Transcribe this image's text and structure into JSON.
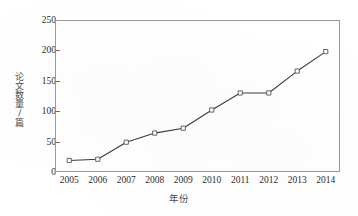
{
  "chart_data": {
    "type": "line",
    "title": "",
    "subtitle": "",
    "xlabel": "年份",
    "ylabel": "论文数量/篇",
    "categories": [
      "2005",
      "2006",
      "2007",
      "2008",
      "2009",
      "2010",
      "2011",
      "2012",
      "2013",
      "2014"
    ],
    "values": [
      19,
      21,
      49,
      64,
      72,
      102,
      130,
      130,
      166,
      198
    ],
    "series": [
      {
        "name": "论文数量",
        "values": [
          19,
          21,
          49,
          64,
          72,
          102,
          130,
          130,
          166,
          198
        ]
      }
    ],
    "ylim": [
      0,
      250
    ],
    "yticks": [
      0,
      50,
      100,
      150,
      200,
      250
    ],
    "ytick_labels": [
      "0",
      "50",
      "100",
      "150",
      "200",
      "250"
    ],
    "xtick_labels": [
      "2005",
      "2006",
      "2007",
      "2008",
      "2009",
      "2010",
      "2011",
      "2012",
      "2013",
      "2014"
    ],
    "grid": false,
    "legend": false,
    "legend_position": "none",
    "marker": "open-square",
    "line_color": "#3b3b3b",
    "marker_face_color": "#ffffff",
    "marker_edge_color": "#555555",
    "axis_color": "#9a9a9a",
    "background_color": "#ffffff",
    "annotations": []
  }
}
